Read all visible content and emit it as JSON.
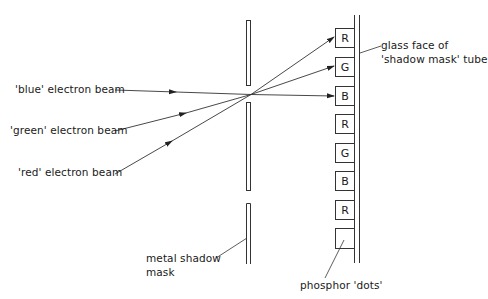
{
  "diagram": {
    "title": "",
    "beams": [
      {
        "id": "blue",
        "label": "'blue' electron beam",
        "target": "B"
      },
      {
        "id": "green",
        "label": "'green' electron beam",
        "target": "G"
      },
      {
        "id": "red",
        "label": "'red' electron beam",
        "target": "R"
      }
    ],
    "phosphor_dots": [
      "R",
      "G",
      "B",
      "R",
      "G",
      "B",
      "R",
      ""
    ],
    "labels": {
      "glass_face_line1": "glass face of",
      "glass_face_line2": "'shadow mask' tube",
      "mask_line1": "metal shadow",
      "mask_line2": "mask",
      "phosphor": "phosphor 'dots'"
    },
    "colors": {
      "line": "#333333",
      "background": "#ffffff"
    }
  }
}
